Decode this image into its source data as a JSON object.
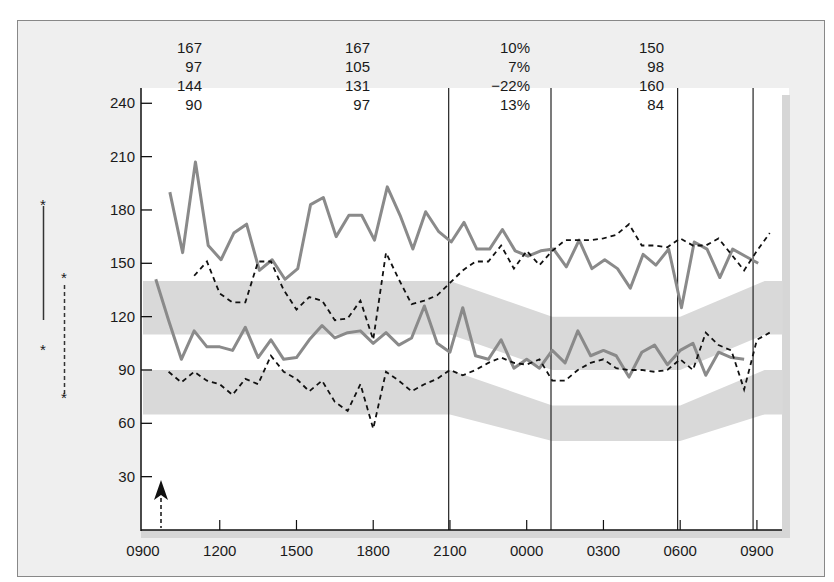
{
  "chart_data": {
    "type": "line",
    "title": "",
    "xlabel": "",
    "ylabel": "",
    "ylim": [
      0,
      255
    ],
    "xlim_hours": [
      0,
      25.5
    ],
    "y_ticks": [
      30,
      60,
      90,
      120,
      150,
      180,
      210,
      240
    ],
    "x_ticks": [
      {
        "label": "0900",
        "hour": 0
      },
      {
        "label": "1200",
        "hour": 3
      },
      {
        "label": "1500",
        "hour": 6
      },
      {
        "label": "1800",
        "hour": 9
      },
      {
        "label": "2100",
        "hour": 12
      },
      {
        "label": "0000",
        "hour": 15
      },
      {
        "label": "0300",
        "hour": 18
      },
      {
        "label": "0600",
        "hour": 21
      },
      {
        "label": "0900",
        "hour": 24
      }
    ],
    "vertical_markers_hours": [
      11.95,
      15.95,
      20.9,
      23.85
    ],
    "stats_table": {
      "columns": [
        [
          "167",
          "97",
          "144",
          "90"
        ],
        [
          "167",
          "105",
          "131",
          "97"
        ],
        [
          "10%",
          "7%",
          "−22%",
          "13%"
        ],
        [
          "150",
          "98",
          "160",
          "84"
        ]
      ]
    },
    "legend": [
      {
        "name": "solid",
        "style": "solid",
        "marker": "*"
      },
      {
        "name": "dashed",
        "style": "dashed",
        "marker": "*"
      }
    ],
    "annotations": [
      {
        "type": "arrow-up",
        "hour": 0.7,
        "label": ""
      }
    ],
    "bands": [
      {
        "name": "upper-normal-band",
        "points": [
          [
            0,
            110,
            140
          ],
          [
            12,
            110,
            140
          ],
          [
            16,
            90,
            120
          ],
          [
            21,
            90,
            120
          ],
          [
            24.3,
            110,
            140
          ],
          [
            25,
            110,
            140
          ]
        ]
      },
      {
        "name": "lower-normal-band",
        "points": [
          [
            0,
            65,
            90
          ],
          [
            12,
            65,
            90
          ],
          [
            16,
            50,
            70
          ],
          [
            21,
            50,
            70
          ],
          [
            24.3,
            65,
            90
          ],
          [
            25,
            65,
            90
          ]
        ]
      }
    ],
    "series": [
      {
        "name": "solid-upper",
        "style": "solid",
        "start_hour": 1.05,
        "step_hours": 0.5,
        "values": [
          190,
          156,
          207,
          160,
          152,
          167,
          172,
          146,
          152,
          141,
          147,
          183,
          187,
          165,
          177,
          177,
          163,
          193,
          177,
          158,
          179,
          168,
          162,
          173,
          158,
          158,
          169,
          157,
          154,
          157,
          158,
          148,
          163,
          147,
          152,
          147,
          136,
          155,
          149,
          158,
          125,
          162,
          158,
          142,
          158,
          154,
          150
        ]
      },
      {
        "name": "dashed-upper",
        "style": "dashed",
        "start_hour": 2.0,
        "step_hours": 0.5,
        "values": [
          143,
          151,
          133,
          128,
          128,
          151,
          151,
          135,
          124,
          131,
          129,
          118,
          119,
          129,
          107,
          156,
          141,
          127,
          129,
          132,
          139,
          146,
          151,
          151,
          160,
          147,
          157,
          149,
          157,
          163,
          163,
          163,
          164,
          166,
          172,
          160,
          160,
          159,
          164,
          160,
          160,
          164,
          155,
          146,
          157,
          167
        ]
      },
      {
        "name": "solid-lower",
        "style": "solid",
        "start_hour": 0.5,
        "step_hours": 0.5,
        "values": [
          141,
          118,
          96,
          112,
          103,
          103,
          101,
          114,
          97,
          107,
          96,
          97,
          107,
          115,
          108,
          111,
          112,
          105,
          111,
          104,
          108,
          126,
          105,
          100,
          125,
          98,
          96,
          107,
          91,
          96,
          91,
          101,
          94,
          112,
          98,
          101,
          98,
          86,
          100,
          104,
          93,
          101,
          105,
          87,
          100,
          97,
          96
        ]
      },
      {
        "name": "dashed-lower",
        "style": "dashed",
        "start_hour": 1.0,
        "step_hours": 0.5,
        "values": [
          89,
          83,
          89,
          84,
          82,
          76,
          85,
          82,
          98,
          89,
          85,
          78,
          84,
          72,
          67,
          82,
          57,
          89,
          84,
          78,
          82,
          85,
          90,
          87,
          90,
          94,
          97,
          94,
          93,
          96,
          84,
          84,
          90,
          94,
          96,
          91,
          90,
          90,
          89,
          90,
          96,
          90,
          111,
          104,
          101,
          79,
          107,
          111
        ]
      }
    ]
  }
}
